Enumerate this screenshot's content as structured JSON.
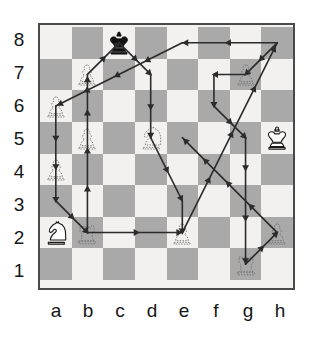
{
  "diagram": {
    "type": "chess-board",
    "board": {
      "files": [
        "a",
        "b",
        "c",
        "d",
        "e",
        "f",
        "g",
        "h"
      ],
      "ranks": [
        "8",
        "7",
        "6",
        "5",
        "4",
        "3",
        "2",
        "1"
      ],
      "light_color": "#f2f1ef",
      "dark_color": "#a9a9a9",
      "border_color": "#4a4a4a",
      "size": 8
    },
    "labels": {
      "files": [
        "a",
        "b",
        "c",
        "d",
        "e",
        "f",
        "g",
        "h"
      ],
      "ranks": [
        "8",
        "7",
        "6",
        "5",
        "4",
        "3",
        "2",
        "1"
      ],
      "label_color": "#151515"
    },
    "pieces": [
      {
        "square": "c8",
        "color": "black",
        "type": "king",
        "style": "solid",
        "glyph": "king-icon"
      },
      {
        "square": "b7",
        "color": "white",
        "type": "pawn",
        "style": "ghost",
        "glyph": "pawn-icon"
      },
      {
        "square": "g7",
        "color": "white",
        "type": "pawn",
        "style": "ghost",
        "glyph": "pawn-icon"
      },
      {
        "square": "a6",
        "color": "white",
        "type": "pawn",
        "style": "ghost",
        "glyph": "pawn-icon"
      },
      {
        "square": "b5",
        "color": "white",
        "type": "pawn",
        "style": "ghost",
        "glyph": "pawn-icon"
      },
      {
        "square": "d5",
        "color": "white",
        "type": "knight",
        "style": "ghost",
        "glyph": "knight-icon"
      },
      {
        "square": "h5",
        "color": "white",
        "type": "king",
        "style": "solid",
        "glyph": "king-icon"
      },
      {
        "square": "a4",
        "color": "white",
        "type": "pawn",
        "style": "ghost",
        "glyph": "pawn-icon"
      },
      {
        "square": "a2",
        "color": "white",
        "type": "knight",
        "style": "solid",
        "glyph": "knight-icon"
      },
      {
        "square": "b2",
        "color": "white",
        "type": "rook",
        "style": "ghost",
        "glyph": "rook-icon"
      },
      {
        "square": "e2",
        "color": "white",
        "type": "pawn",
        "style": "ghost",
        "glyph": "pawn-icon"
      },
      {
        "square": "h2",
        "color": "white",
        "type": "pawn",
        "style": "ghost",
        "glyph": "pawn-icon"
      },
      {
        "square": "g1",
        "color": "white",
        "type": "rook",
        "style": "ghost",
        "glyph": "rook-icon"
      }
    ],
    "path": {
      "color": "#2b2b2b",
      "line_width": 1.6,
      "arrow_style": "filled-triangle-midpoint",
      "segments": [
        {
          "from": "b2",
          "to": "b7"
        },
        {
          "from": "b7",
          "to": "c8"
        },
        {
          "from": "c8",
          "to": "d7"
        },
        {
          "from": "d7",
          "to": "d5"
        },
        {
          "from": "d5",
          "to": "e3"
        },
        {
          "from": "e3",
          "to": "e2"
        },
        {
          "from": "b2",
          "to": "e2"
        },
        {
          "from": "e2",
          "to": "h8"
        },
        {
          "from": "h8",
          "to": "e8"
        },
        {
          "from": "e8",
          "to": "a6"
        },
        {
          "from": "a6",
          "to": "a4"
        },
        {
          "from": "a4",
          "to": "a3"
        },
        {
          "from": "a3",
          "to": "b2"
        },
        {
          "from": "h8",
          "to": "g7"
        },
        {
          "from": "g7",
          "to": "f7"
        },
        {
          "from": "f7",
          "to": "f6"
        },
        {
          "from": "f6",
          "to": "g5"
        },
        {
          "from": "g5",
          "to": "g4"
        },
        {
          "from": "g4",
          "to": "g1"
        },
        {
          "from": "g1",
          "to": "h2"
        },
        {
          "from": "h2",
          "to": "e5"
        }
      ]
    }
  }
}
